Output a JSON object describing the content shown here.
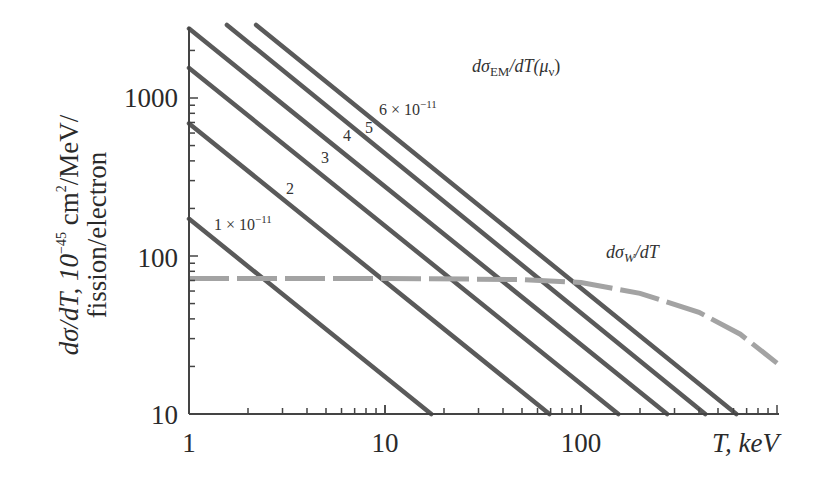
{
  "chart_data": {
    "type": "line",
    "scale": {
      "x": "log",
      "y": "log"
    },
    "xlim": [
      1,
      1000
    ],
    "ylim": [
      10,
      2900
    ],
    "xlabel": "T, keV",
    "ylabel_line1": "dσ/dT, 10⁻⁴⁵ cm²/MeV/",
    "ylabel_line2": "fission/electron",
    "x_ticks": [
      1,
      10,
      100
    ],
    "x_tick_labels": [
      "1",
      "10",
      "100"
    ],
    "y_ticks": [
      10,
      100,
      1000
    ],
    "y_tick_labels": [
      "10",
      "100",
      "1000"
    ],
    "grid": false,
    "series": [
      {
        "name": "dσ_EM/dT(μ_ν) μ=1×10⁻¹¹",
        "style": "solid",
        "label": "1 × 10⁻¹¹",
        "x": [
          1,
          17.2
        ],
        "values": [
          172,
          10
        ]
      },
      {
        "name": "dσ_EM/dT(μ_ν) μ=2×10⁻¹¹",
        "style": "solid",
        "label": "2",
        "x": [
          1,
          69
        ],
        "values": [
          690,
          10
        ]
      },
      {
        "name": "dσ_EM/dT(μ_ν) μ=3×10⁻¹¹",
        "style": "solid",
        "label": "3",
        "x": [
          1,
          155
        ],
        "values": [
          1550,
          10
        ]
      },
      {
        "name": "dσ_EM/dT(μ_ν) μ=4×10⁻¹¹",
        "style": "solid",
        "label": "4",
        "x": [
          1,
          275
        ],
        "values": [
          2750,
          10
        ]
      },
      {
        "name": "dσ_EM/dT(μ_ν) μ=5×10⁻¹¹",
        "style": "solid",
        "label": "5",
        "x": [
          1.56,
          430
        ],
        "values": [
          2900,
          10
        ]
      },
      {
        "name": "dσ_EM/dT(μ_ν) μ=6×10⁻¹¹",
        "style": "solid",
        "label": "6 × 10⁻¹¹",
        "x": [
          2.2,
          620
        ],
        "values": [
          2900,
          10
        ]
      },
      {
        "name": "dσ_W/dT",
        "style": "dashed",
        "x": [
          1,
          10,
          50,
          100,
          200,
          400,
          650,
          1000
        ],
        "values": [
          72,
          72,
          71,
          68,
          58,
          44,
          32,
          21
        ]
      }
    ],
    "annotations": [
      {
        "text": "dσ_EM/dT(μ_ν)",
        "x": 60,
        "y": 2000
      },
      {
        "text": "dσ_W/dT",
        "x": 100,
        "y": 100
      }
    ]
  },
  "labels": {
    "y_1000": "1000",
    "y_100": "100",
    "y_10": "10",
    "x_1": "1",
    "x_10": "10",
    "x_100": "100",
    "x_title": "T, keV",
    "y_title_1": "dσ/dT, 10",
    "y_title_exp": "−45",
    "y_title_2": " cm",
    "y_title_sq": "2",
    "y_title_3": "/MeV/",
    "y_title_line2": "fission/electron",
    "em_title": "dσ",
    "em_sub": "EM",
    "em_rest": "/dT(μ",
    "em_nu": "ν",
    "em_close": ")",
    "w_title": "dσ",
    "w_sub": "W",
    "w_rest": "/dT",
    "mu1": "1 × 10",
    "mu1_exp": "−11",
    "mu2": "2",
    "mu3": "3",
    "mu4": "4",
    "mu5": "5",
    "mu6": "6 × 10",
    "mu6_exp": "−11"
  }
}
